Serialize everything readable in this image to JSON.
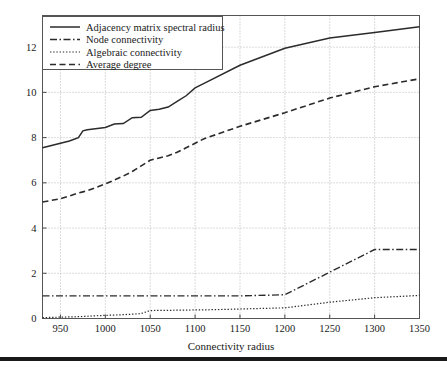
{
  "chart_data": {
    "type": "line",
    "title": "",
    "xlabel": "Connectivity radius",
    "ylabel": "",
    "xlim": [
      930,
      1350
    ],
    "ylim": [
      0,
      13.4
    ],
    "xticks": [
      950,
      1000,
      1050,
      1100,
      1150,
      1200,
      1250,
      1300,
      1350
    ],
    "yticks": [
      0,
      2,
      4,
      6,
      8,
      10,
      12
    ],
    "grid": true,
    "legend_position": "upper-left",
    "x": [
      930,
      950,
      960,
      970,
      975,
      980,
      1000,
      1010,
      1020,
      1030,
      1040,
      1050,
      1060,
      1070,
      1080,
      1090,
      1100,
      1110,
      1150,
      1200,
      1250,
      1300,
      1350
    ],
    "series": [
      {
        "name": "Adjacency matrix spectral radius",
        "style": "solid",
        "values": [
          7.55,
          7.75,
          7.85,
          8.0,
          8.3,
          8.35,
          8.45,
          8.6,
          8.62,
          8.88,
          8.9,
          9.2,
          9.25,
          9.35,
          9.6,
          9.85,
          10.2,
          10.4,
          11.2,
          11.95,
          12.4,
          12.65,
          12.9
        ]
      },
      {
        "name": "Node connectivity",
        "style": "dash-dot",
        "values": [
          1.0,
          1.0,
          1.0,
          1.0,
          1.0,
          1.0,
          1.0,
          1.0,
          1.0,
          1.0,
          1.0,
          1.0,
          1.0,
          1.0,
          1.0,
          1.0,
          1.0,
          1.0,
          1.0,
          1.05,
          2.05,
          3.05,
          3.05
        ]
      },
      {
        "name": "Algebraic connectivity",
        "style": "dotted",
        "values": [
          0.04,
          0.06,
          0.07,
          0.08,
          0.09,
          0.1,
          0.14,
          0.15,
          0.17,
          0.19,
          0.22,
          0.35,
          0.36,
          0.36,
          0.37,
          0.37,
          0.38,
          0.38,
          0.42,
          0.47,
          0.72,
          0.92,
          1.02
        ]
      },
      {
        "name": "Average degree",
        "style": "dashed",
        "values": [
          5.15,
          5.3,
          5.42,
          5.55,
          5.6,
          5.65,
          5.95,
          6.12,
          6.3,
          6.5,
          6.75,
          7.0,
          7.1,
          7.2,
          7.35,
          7.55,
          7.75,
          7.95,
          8.5,
          9.1,
          9.75,
          10.25,
          10.6
        ]
      }
    ]
  },
  "legend": {
    "entries": [
      {
        "label": "Adjacency matrix spectral radius",
        "style": "solid"
      },
      {
        "label": "Node connectivity",
        "style": "dash-dot"
      },
      {
        "label": "Algebraic connectivity",
        "style": "dotted"
      },
      {
        "label": "Average degree",
        "style": "dashed"
      }
    ]
  },
  "axes": {
    "xlabel": "Connectivity radius",
    "xticklabels": [
      "950",
      "1000",
      "1050",
      "1100",
      "1150",
      "1200",
      "1250",
      "1300",
      "1350"
    ],
    "yticklabels": [
      "0",
      "2",
      "4",
      "6",
      "8",
      "10",
      "12"
    ]
  },
  "colors": {
    "line": "#2b2b2b",
    "grid": "#9a9a9a",
    "frame": "#555555",
    "background": "#ffffff",
    "rule": "#1a1a1a"
  }
}
